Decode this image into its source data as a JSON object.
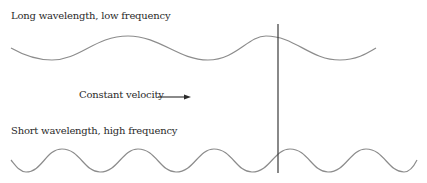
{
  "diagram": {
    "long_wave_label": "Long wavelength, low frequency",
    "velocity_label": "Constant velocity",
    "short_wave_label": "Short wavelength, high frequency",
    "colors": {
      "wave": "#8c8c8c",
      "marker_line": "#3a3a3a",
      "arrow": "#2a2a2a",
      "text": "#2a2a2a"
    }
  }
}
